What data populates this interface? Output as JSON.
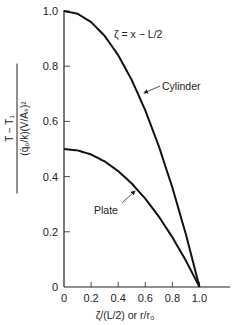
{
  "chart_data": {
    "type": "line",
    "title": "",
    "xlabel": "ζ/(L/2) or r/r₀",
    "ylabel": {
      "numerator": "T − T₁",
      "denominator": "(q̇₀/k)(V/Aₛ)²"
    },
    "xlim": [
      0,
      1.15
    ],
    "ylim": [
      0,
      1.0
    ],
    "grid": false,
    "x_ticks": [
      "0",
      "0.2",
      "0.4",
      "0.6",
      "0.8",
      "1.0"
    ],
    "y_ticks": [
      "0",
      "0.2",
      "0.4",
      "0.6",
      "0.8",
      "1.0"
    ],
    "x": [
      0,
      0.1,
      0.2,
      0.3,
      0.4,
      0.5,
      0.6,
      0.7,
      0.8,
      0.9,
      1.0
    ],
    "series": [
      {
        "name": "Cylinder",
        "values": [
          1.0,
          0.99,
          0.96,
          0.91,
          0.84,
          0.75,
          0.64,
          0.51,
          0.36,
          0.19,
          0.0
        ]
      },
      {
        "name": "Plate",
        "values": [
          0.5,
          0.495,
          0.48,
          0.455,
          0.42,
          0.375,
          0.32,
          0.255,
          0.18,
          0.095,
          0.0
        ]
      }
    ],
    "annotations": [
      {
        "text": "ζ = x − L/2"
      },
      {
        "text": "Cylinder",
        "arrow_to": "Cylinder"
      },
      {
        "text": "Plate",
        "arrow_to": "Plate"
      }
    ]
  }
}
